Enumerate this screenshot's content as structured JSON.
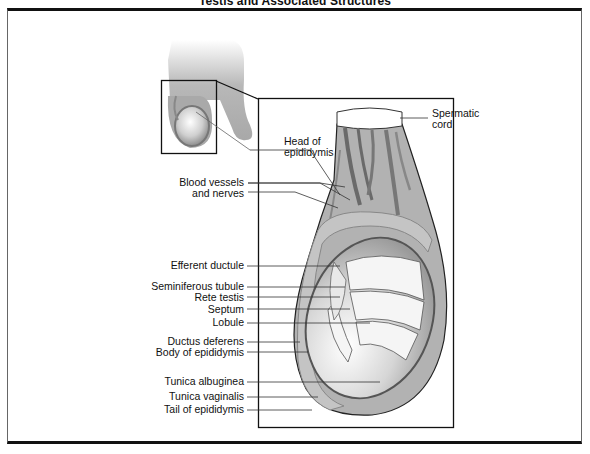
{
  "title": "Testis and Associated Structures",
  "labels": {
    "spermatic_cord_1": "Spermatic",
    "spermatic_cord_2": "cord",
    "head_epididymis_1": "Head of",
    "head_epididymis_2": "epididymis",
    "blood_vessels_1": "Blood vessels",
    "blood_vessels_2": "and nerves",
    "efferent_ductule": "Efferent ductule",
    "seminiferous_tubule": "Seminiferous tubule",
    "rete_testis": "Rete testis",
    "septum": "Septum",
    "lobule": "Lobule",
    "ductus_deferens": "Ductus deferens",
    "body_epididymis": "Body of epididymis",
    "tunica_albuginea": "Tunica albuginea",
    "tunica_vaginalis": "Tunica vaginalis",
    "tail_epididymis": "Tail of epididymis"
  },
  "colors": {
    "tissue_gray": "#a8a8a8",
    "dark_vessel": "#6e6e6e",
    "border": "#111111",
    "background": "#ffffff"
  }
}
